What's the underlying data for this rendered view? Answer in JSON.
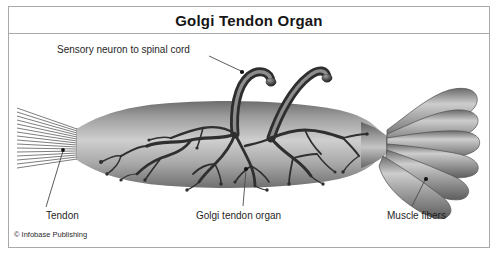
{
  "figure": {
    "title": "Golgi Tendon Organ",
    "credit": "© Infobase Publishing",
    "border_color": "#a9a9a9",
    "background": "#ffffff"
  },
  "labels": {
    "sensory_neuron": "Sensory neuron to spinal cord",
    "tendon": "Tendon",
    "golgi_tendon_organ": "Golgi tendon organ",
    "muscle_fibers": "Muscle fibers"
  },
  "anatomy": {
    "tendon_strand_count": 16,
    "muscle_fiber_count": 6,
    "nerve_trunk_count": 2,
    "capsule_color_light": "#d2d2d2",
    "capsule_color_mid": "#a0a0a0",
    "capsule_color_dark": "#5c5c5c",
    "nerve_color": "#2f2f2f",
    "leader_line_color": "#4a4a4a"
  }
}
